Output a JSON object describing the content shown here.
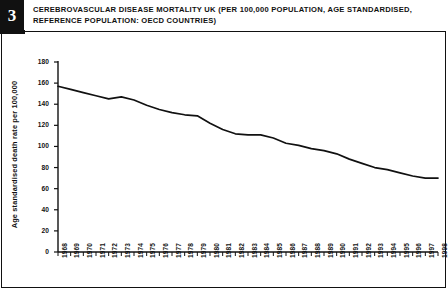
{
  "header": {
    "badge_number": "3",
    "title": "CEREBROVASCULAR DISEASE MORTALITY UK (PER 100,000 POPULATION, AGE STANDARDISED, REFERENCE POPULATION: OECD COUNTRIES)"
  },
  "colors": {
    "line": "#111111",
    "axis": "#111111",
    "background": "#ffffff",
    "badge_background": "#111111",
    "badge_text": "#ffffff"
  },
  "chart_data": {
    "type": "line",
    "title": "CEREBROVASCULAR DISEASE MORTALITY UK (PER 100,000 POPULATION, AGE STANDARDISED, REFERENCE POPULATION: OECD COUNTRIES)",
    "xlabel": "",
    "ylabel": "Age standardised death rate per 100,000",
    "ylim": [
      0,
      180
    ],
    "yticks": [
      0,
      20,
      40,
      60,
      80,
      100,
      120,
      140,
      160,
      180
    ],
    "ytick_labels": [
      "0",
      "20",
      "40",
      "60",
      "80",
      "100",
      "120",
      "140",
      "160",
      "180"
    ],
    "grid": false,
    "legend": "none",
    "x": [
      "1968",
      "1969",
      "1970",
      "1971",
      "1972",
      "1973",
      "1974",
      "1975",
      "1976",
      "1977",
      "1978",
      "1979",
      "1980",
      "1981",
      "1982",
      "1983",
      "1984",
      "1985",
      "1986",
      "1987",
      "1988",
      "1989",
      "1990",
      "1991",
      "1992",
      "1993",
      "1994",
      "1995",
      "1996",
      "1997",
      "1998"
    ],
    "series": [
      {
        "name": "Age standardised death rate per 100,000",
        "values": [
          157,
          154,
          151,
          148,
          145,
          147,
          144,
          139,
          135,
          132,
          130,
          129,
          122,
          116,
          112,
          111,
          111,
          108,
          103,
          101,
          98,
          96,
          93,
          88,
          84,
          80,
          78,
          75,
          72,
          70,
          70
        ]
      }
    ]
  }
}
